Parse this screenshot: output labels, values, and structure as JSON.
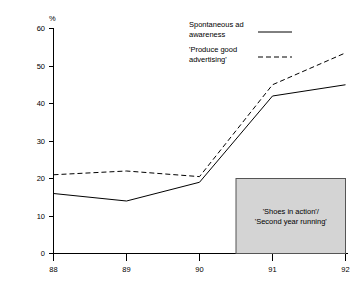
{
  "chart_data": {
    "type": "line",
    "title": "",
    "xlabel": "",
    "ylabel": "%",
    "categories": [
      "88",
      "89",
      "90",
      "91",
      "92"
    ],
    "ylim": [
      0,
      60
    ],
    "yticks": [
      0,
      10,
      20,
      30,
      40,
      50,
      60
    ],
    "grid": false,
    "legend_position": "top-right",
    "series": [
      {
        "name": "Spontaneous ad awareness",
        "style": "solid",
        "color": "#000000",
        "values": [
          16,
          14,
          19,
          42,
          45
        ]
      },
      {
        "name": "'Produce good advertising'",
        "style": "dashed",
        "color": "#000000",
        "values": [
          21,
          22,
          20.5,
          45,
          53.5
        ]
      }
    ],
    "annotations": [
      {
        "name": "campaign-period-box",
        "line1": "'Shoes in action'/",
        "line2": "'Second year running'",
        "x_start": 90.5,
        "x_end": 92,
        "y_start": 0,
        "y_end": 20,
        "fill": "#d4d4d4",
        "border": "#555555"
      }
    ]
  },
  "axis": {
    "unit_label": "%",
    "y_tick_labels": [
      "60",
      "50",
      "40",
      "30",
      "20",
      "10",
      "0"
    ],
    "x_tick_labels": [
      "88",
      "89",
      "90",
      "91",
      "92"
    ]
  },
  "legend": {
    "entries": [
      {
        "line1": "Spontaneous ad",
        "line2": "awareness",
        "style": "solid"
      },
      {
        "line1": "'Produce good",
        "line2": "advertising'",
        "style": "dashed"
      }
    ]
  },
  "annotation_box": {
    "line1": "'Shoes in action'/",
    "line2": "'Second year running'"
  }
}
